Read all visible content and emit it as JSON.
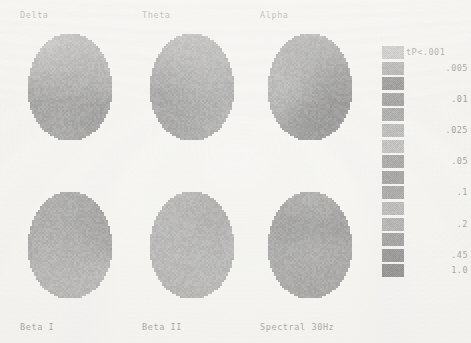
{
  "figure": {
    "background_color": "#f3f2ef",
    "text_color": "#70706e",
    "width": 471,
    "height": 343
  },
  "maps": [
    {
      "id": "delta",
      "title": "Delta",
      "caption": "",
      "row": 0,
      "col": 0,
      "title_position": "top"
    },
    {
      "id": "theta",
      "title": "Theta",
      "caption": "",
      "row": 0,
      "col": 1,
      "title_position": "top"
    },
    {
      "id": "alpha",
      "title": "Alpha",
      "caption": "",
      "row": 0,
      "col": 2,
      "title_position": "top"
    },
    {
      "id": "beta1",
      "title": "",
      "caption": "Beta I",
      "row": 1,
      "col": 0,
      "title_position": "bottom"
    },
    {
      "id": "beta2",
      "title": "",
      "caption": "Beta II",
      "row": 1,
      "col": 1,
      "title_position": "bottom"
    },
    {
      "id": "spectral30",
      "title": "",
      "caption": "Spectral 30Hz",
      "row": 1,
      "col": 2,
      "title_position": "bottom"
    }
  ],
  "legend": {
    "title": "tP<.001",
    "entries": [
      {
        "label": "tP<.001",
        "color": "#aaaaa6",
        "show_label": true
      },
      {
        "label": ".005",
        "color": "#8e8e8c",
        "show_label": true
      },
      {
        "label": "",
        "color": "#6a6a6a",
        "show_label": false
      },
      {
        "label": ".01",
        "color": "#7e7e7c",
        "show_label": true
      },
      {
        "label": "",
        "color": "#888884",
        "show_label": false
      },
      {
        "label": ".025",
        "color": "#9c9c98",
        "show_label": true
      },
      {
        "label": "",
        "color": "#a4a4a0",
        "show_label": false
      },
      {
        "label": ".05",
        "color": "#7c7c7a",
        "show_label": true
      },
      {
        "label": "",
        "color": "#737371",
        "show_label": false
      },
      {
        "label": ".1",
        "color": "#7a7a78",
        "show_label": true
      },
      {
        "label": "",
        "color": "#969692",
        "show_label": false
      },
      {
        "label": ".2",
        "color": "#8a8a86",
        "show_label": true
      },
      {
        "label": "",
        "color": "#6f6f6d",
        "show_label": false
      },
      {
        "label": ".45",
        "color": "#5f5f5d",
        "show_label": true
      },
      {
        "label": "1.0",
        "color": "#565654",
        "show_label": true
      }
    ]
  },
  "chart_data": {
    "type": "heatmap",
    "subtitle": "",
    "xlabel": "",
    "ylabel": "",
    "legend_position": "right",
    "grid": false,
    "colorbar": {
      "kind": "discrete",
      "variable": "t-test probability (p)",
      "tick_labels": [
        "tP<.001",
        ".005",
        ".01",
        ".025",
        ".05",
        ".1",
        ".2",
        ".45",
        "1.0"
      ],
      "tick_values": [
        0.001,
        0.005,
        0.01,
        0.025,
        0.05,
        0.1,
        0.2,
        0.45,
        1.0
      ],
      "n_levels": 15
    },
    "panels": [
      {
        "name": "Delta",
        "row": 0,
        "col": 0,
        "description": "Topographic head map, left-frontal and posterior regions lighter (more significant), right-posterior darker",
        "mean_level": 0.05,
        "regions": [
          {
            "area": "left-frontal",
            "level": 0.025
          },
          {
            "area": "right-frontal",
            "level": 0.2
          },
          {
            "area": "central",
            "level": 0.01
          },
          {
            "area": "left-posterior",
            "level": 0.1
          },
          {
            "area": "right-posterior",
            "level": 0.45
          }
        ]
      },
      {
        "name": "Theta",
        "row": 0,
        "col": 1,
        "description": "Mostly uniform mid-grey with a darker left-temporal focus",
        "mean_level": 0.2,
        "regions": [
          {
            "area": "global",
            "level": 0.2
          },
          {
            "area": "left-temporal",
            "level": 0.45
          },
          {
            "area": "left-occipital",
            "level": 1.0
          }
        ]
      },
      {
        "name": "Alpha",
        "row": 0,
        "col": 2,
        "description": "Highly heterogeneous, strong dark posterior field with scattered light foci anteriorly",
        "mean_level": 0.45,
        "regions": [
          {
            "area": "frontal",
            "level": 0.1
          },
          {
            "area": "left-central",
            "level": 0.025
          },
          {
            "area": "right-central",
            "level": 0.45
          },
          {
            "area": "posterior",
            "level": 1.0
          }
        ]
      },
      {
        "name": "Beta I",
        "row": 1,
        "col": 0,
        "description": "Light frontal field with bright occipital foci and darker right hemisphere",
        "mean_level": 0.1,
        "regions": [
          {
            "area": "frontal",
            "level": 0.05
          },
          {
            "area": "right-frontal",
            "level": 0.45
          },
          {
            "area": "central",
            "level": 0.2
          },
          {
            "area": "occipital",
            "level": 0.005
          }
        ]
      },
      {
        "name": "Beta II",
        "row": 1,
        "col": 1,
        "description": "Nearly uniform light field with a single dark right-frontal patch",
        "mean_level": 0.05,
        "regions": [
          {
            "area": "global",
            "level": 0.05
          },
          {
            "area": "right-frontal",
            "level": 0.45
          }
        ]
      },
      {
        "name": "Spectral 30Hz",
        "row": 1,
        "col": 2,
        "description": "Predominantly dark with light bands at the frontal rim and mid-occipital",
        "mean_level": 0.45,
        "regions": [
          {
            "area": "frontal-rim",
            "level": 0.05
          },
          {
            "area": "anterior",
            "level": 1.0
          },
          {
            "area": "mid-band",
            "level": 0.2
          },
          {
            "area": "posterior",
            "level": 0.45
          },
          {
            "area": "occipital-focus",
            "level": 0.1
          }
        ]
      }
    ]
  }
}
